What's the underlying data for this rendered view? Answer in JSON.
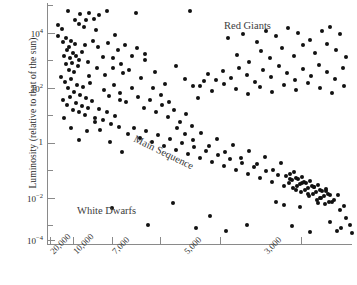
{
  "chart_data": {
    "type": "scatter",
    "title": "",
    "xlabel": "",
    "ylabel": "Luminosity (relative to that of the sun)",
    "x_scale": "log-reversed",
    "y_scale": "log",
    "xlim": [
      30000,
      2200
    ],
    "ylim": [
      0.0001,
      100000
    ],
    "grid": false,
    "legend": "none",
    "x_tick_labels": [
      "20,000",
      "10,000",
      "7,000",
      "5,000",
      "3,000"
    ],
    "x_tick_values": [
      20000,
      10000,
      7000,
      5000,
      3000
    ],
    "y_tick_labels": [
      "10⁴",
      "10²",
      "1",
      "10⁻²",
      "10⁻⁴"
    ],
    "y_tick_values": [
      10000,
      100,
      1,
      0.01,
      0.0001
    ],
    "y_minor_tick_values": [
      100000,
      1000,
      10,
      0.1,
      0.001
    ],
    "annotations": [
      {
        "text": "Red Giants",
        "x": 4200,
        "y": 20000
      },
      {
        "text": "Main Sequence",
        "x": 8200,
        "y": 1.2
      },
      {
        "text": "White Dwarfs",
        "x": 11500,
        "y": 0.0013
      }
    ],
    "point_color": "#111111",
    "axis_color": "#8a8a8a",
    "points": [
      [
        68,
        11
      ],
      [
        75,
        20
      ],
      [
        79,
        24
      ],
      [
        80,
        14
      ],
      [
        84,
        27
      ],
      [
        86,
        20
      ],
      [
        89,
        13
      ],
      [
        94,
        19
      ],
      [
        99,
        15
      ],
      [
        107,
        11
      ],
      [
        136,
        13
      ],
      [
        190,
        11
      ],
      [
        58,
        36
      ],
      [
        63,
        42
      ],
      [
        66,
        38
      ],
      [
        69,
        47
      ],
      [
        71,
        41
      ],
      [
        73,
        53
      ],
      [
        75,
        44
      ],
      [
        64,
        56
      ],
      [
        67,
        50
      ],
      [
        70,
        58
      ],
      [
        72,
        63
      ],
      [
        76,
        56
      ],
      [
        78,
        66
      ],
      [
        66,
        64
      ],
      [
        69,
        70
      ],
      [
        74,
        72
      ],
      [
        79,
        60
      ],
      [
        82,
        52
      ],
      [
        85,
        45
      ],
      [
        88,
        62
      ],
      [
        93,
        41
      ],
      [
        98,
        47
      ],
      [
        103,
        57
      ],
      [
        108,
        43
      ],
      [
        113,
        68
      ],
      [
        118,
        50
      ],
      [
        123,
        73
      ],
      [
        61,
        77
      ],
      [
        65,
        82
      ],
      [
        68,
        88
      ],
      [
        71,
        79
      ],
      [
        74,
        92
      ],
      [
        77,
        85
      ],
      [
        80,
        95
      ],
      [
        83,
        87
      ],
      [
        86,
        98
      ],
      [
        90,
        83
      ],
      [
        63,
        100
      ],
      [
        67,
        105
      ],
      [
        70,
        97
      ],
      [
        73,
        110
      ],
      [
        76,
        103
      ],
      [
        79,
        112
      ],
      [
        82,
        106
      ],
      [
        85,
        115
      ],
      [
        88,
        108
      ],
      [
        92,
        101
      ],
      [
        95,
        118
      ],
      [
        99,
        109
      ],
      [
        103,
        120
      ],
      [
        107,
        112
      ],
      [
        111,
        124
      ],
      [
        115,
        116
      ],
      [
        119,
        127
      ],
      [
        104,
        90
      ],
      [
        109,
        96
      ],
      [
        114,
        85
      ],
      [
        120,
        93
      ],
      [
        126,
        102
      ],
      [
        132,
        88
      ],
      [
        138,
        97
      ],
      [
        144,
        108
      ],
      [
        150,
        100
      ],
      [
        156,
        112
      ],
      [
        162,
        105
      ],
      [
        168,
        117
      ],
      [
        174,
        110
      ],
      [
        180,
        122
      ],
      [
        186,
        114
      ],
      [
        192,
        126
      ],
      [
        128,
        134
      ],
      [
        134,
        128
      ],
      [
        140,
        138
      ],
      [
        146,
        131
      ],
      [
        152,
        142
      ],
      [
        158,
        135
      ],
      [
        164,
        146
      ],
      [
        170,
        139
      ],
      [
        176,
        150
      ],
      [
        182,
        143
      ],
      [
        188,
        154
      ],
      [
        194,
        147
      ],
      [
        200,
        158
      ],
      [
        206,
        151
      ],
      [
        212,
        162
      ],
      [
        218,
        155
      ],
      [
        224,
        166
      ],
      [
        230,
        159
      ],
      [
        236,
        170
      ],
      [
        242,
        163
      ],
      [
        248,
        174
      ],
      [
        254,
        167
      ],
      [
        260,
        178
      ],
      [
        266,
        171
      ],
      [
        272,
        182
      ],
      [
        278,
        175
      ],
      [
        284,
        186
      ],
      [
        290,
        179
      ],
      [
        296,
        190
      ],
      [
        302,
        183
      ],
      [
        308,
        194
      ],
      [
        314,
        187
      ],
      [
        320,
        198
      ],
      [
        326,
        191
      ],
      [
        332,
        202
      ],
      [
        338,
        195
      ],
      [
        344,
        206
      ],
      [
        289,
        183
      ],
      [
        293,
        188
      ],
      [
        297,
        186
      ],
      [
        301,
        192
      ],
      [
        305,
        190
      ],
      [
        309,
        196
      ],
      [
        313,
        194
      ],
      [
        317,
        200
      ],
      [
        321,
        198
      ],
      [
        325,
        204
      ],
      [
        329,
        202
      ],
      [
        292,
        180
      ],
      [
        296,
        178
      ],
      [
        300,
        184
      ],
      [
        304,
        182
      ],
      [
        308,
        188
      ],
      [
        312,
        186
      ],
      [
        316,
        192
      ],
      [
        320,
        190
      ],
      [
        324,
        196
      ],
      [
        328,
        194
      ],
      [
        286,
        176
      ],
      [
        290,
        174
      ],
      [
        294,
        172
      ],
      [
        298,
        179
      ],
      [
        302,
        177
      ],
      [
        306,
        183
      ],
      [
        310,
        181
      ],
      [
        314,
        187
      ],
      [
        318,
        185
      ],
      [
        322,
        191
      ],
      [
        326,
        189
      ],
      [
        330,
        195
      ],
      [
        276,
        202
      ],
      [
        334,
        200
      ],
      [
        340,
        210
      ],
      [
        346,
        218
      ],
      [
        350,
        225
      ],
      [
        337,
        231
      ],
      [
        284,
        205
      ],
      [
        318,
        203
      ],
      [
        300,
        207
      ],
      [
        228,
        38
      ],
      [
        243,
        34
      ],
      [
        257,
        42
      ],
      [
        266,
        31
      ],
      [
        276,
        36
      ],
      [
        288,
        28
      ],
      [
        298,
        33
      ],
      [
        310,
        40
      ],
      [
        322,
        31
      ],
      [
        330,
        27
      ],
      [
        340,
        34
      ],
      [
        237,
        55
      ],
      [
        249,
        62
      ],
      [
        261,
        51
      ],
      [
        270,
        58
      ],
      [
        282,
        48
      ],
      [
        294,
        56
      ],
      [
        303,
        45
      ],
      [
        315,
        53
      ],
      [
        327,
        44
      ],
      [
        336,
        50
      ],
      [
        346,
        57
      ],
      [
        208,
        74
      ],
      [
        216,
        80
      ],
      [
        223,
        71
      ],
      [
        231,
        78
      ],
      [
        239,
        68
      ],
      [
        247,
        75
      ],
      [
        255,
        82
      ],
      [
        263,
        70
      ],
      [
        271,
        77
      ],
      [
        279,
        66
      ],
      [
        287,
        73
      ],
      [
        295,
        80
      ],
      [
        303,
        69
      ],
      [
        311,
        76
      ],
      [
        319,
        65
      ],
      [
        327,
        72
      ],
      [
        335,
        79
      ],
      [
        343,
        68
      ],
      [
        200,
        86
      ],
      [
        212,
        91
      ],
      [
        224,
        84
      ],
      [
        236,
        89
      ],
      [
        248,
        94
      ],
      [
        260,
        87
      ],
      [
        272,
        92
      ],
      [
        284,
        85
      ],
      [
        296,
        90
      ],
      [
        308,
        83
      ],
      [
        320,
        88
      ],
      [
        332,
        93
      ],
      [
        344,
        86
      ],
      [
        185,
        79
      ],
      [
        193,
        86
      ],
      [
        204,
        81
      ],
      [
        112,
        208
      ],
      [
        148,
        225
      ],
      [
        173,
        203
      ],
      [
        196,
        228
      ],
      [
        210,
        216
      ],
      [
        226,
        231
      ],
      [
        247,
        225
      ],
      [
        292,
        226
      ],
      [
        310,
        232
      ],
      [
        330,
        222
      ],
      [
        341,
        228
      ],
      [
        352,
        233
      ],
      [
        58,
        25
      ],
      [
        62,
        29
      ],
      [
        96,
        30
      ],
      [
        115,
        35
      ],
      [
        125,
        45
      ],
      [
        145,
        60
      ],
      [
        155,
        72
      ],
      [
        165,
        84
      ],
      [
        198,
        98
      ],
      [
        176,
        66
      ],
      [
        132,
        56
      ],
      [
        141,
        78
      ],
      [
        120,
        100
      ],
      [
        100,
        130
      ],
      [
        110,
        142
      ],
      [
        122,
        152
      ],
      [
        95,
        122
      ],
      [
        87,
        131
      ],
      [
        79,
        140
      ],
      [
        71,
        128
      ],
      [
        64,
        118
      ],
      [
        89,
        76
      ],
      [
        97,
        68
      ],
      [
        105,
        75
      ],
      [
        113,
        58
      ],
      [
        121,
        64
      ],
      [
        129,
        70
      ],
      [
        137,
        48
      ],
      [
        145,
        54
      ],
      [
        153,
        88
      ],
      [
        161,
        95
      ],
      [
        169,
        102
      ],
      [
        177,
        128
      ],
      [
        185,
        134
      ],
      [
        193,
        140
      ],
      [
        201,
        133
      ],
      [
        209,
        146
      ],
      [
        217,
        139
      ],
      [
        225,
        152
      ],
      [
        233,
        145
      ],
      [
        241,
        158
      ],
      [
        249,
        151
      ],
      [
        257,
        164
      ],
      [
        265,
        157
      ],
      [
        273,
        170
      ],
      [
        281,
        163
      ]
    ]
  }
}
